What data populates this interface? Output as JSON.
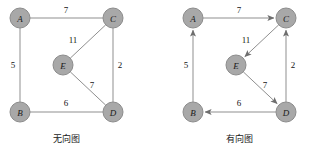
{
  "figure": {
    "width": 323,
    "height": 156,
    "background": "#ffffff",
    "node_fill": "#a8a8a8",
    "node_stroke": "#8c8c8c",
    "edge_color": "#8f8f8f",
    "text_color": "#1a1a1a"
  },
  "graphs": [
    {
      "id": "undirected-graph",
      "caption": "无向图",
      "caption_x": 66,
      "caption_y": 139,
      "directed": false,
      "nodes": [
        {
          "id": "A",
          "label": "A",
          "cx": 20,
          "cy": 18,
          "r": 10
        },
        {
          "id": "C",
          "label": "C",
          "cx": 113,
          "cy": 18,
          "r": 10
        },
        {
          "id": "E",
          "label": "E",
          "cx": 63,
          "cy": 65,
          "r": 10
        },
        {
          "id": "B",
          "label": "B",
          "cx": 20,
          "cy": 112,
          "r": 10
        },
        {
          "id": "D",
          "label": "D",
          "cx": 113,
          "cy": 112,
          "r": 10
        }
      ],
      "edges": [
        {
          "id": "A-C",
          "from": "A",
          "to": "C",
          "weight": "7",
          "lx": 66,
          "ly": 10
        },
        {
          "id": "A-B",
          "from": "A",
          "to": "B",
          "weight": "5",
          "lx": 13,
          "ly": 65
        },
        {
          "id": "C-E",
          "from": "C",
          "to": "E",
          "weight": "11",
          "lx": 73,
          "ly": 40
        },
        {
          "id": "C-D",
          "from": "C",
          "to": "D",
          "weight": "2",
          "lx": 120,
          "ly": 65
        },
        {
          "id": "E-D",
          "from": "E",
          "to": "D",
          "weight": "7",
          "lx": 92,
          "ly": 85
        },
        {
          "id": "B-D",
          "from": "B",
          "to": "D",
          "weight": "6",
          "lx": 66,
          "ly": 103
        }
      ]
    },
    {
      "id": "directed-graph",
      "caption": "有向图",
      "caption_x": 239,
      "caption_y": 139,
      "directed": true,
      "nodes": [
        {
          "id": "A",
          "label": "A",
          "cx": 193,
          "cy": 18,
          "r": 10
        },
        {
          "id": "C",
          "label": "C",
          "cx": 286,
          "cy": 18,
          "r": 10
        },
        {
          "id": "E",
          "label": "E",
          "cx": 236,
          "cy": 65,
          "r": 10
        },
        {
          "id": "B",
          "label": "B",
          "cx": 193,
          "cy": 112,
          "r": 10
        },
        {
          "id": "D",
          "label": "D",
          "cx": 286,
          "cy": 112,
          "r": 10
        }
      ],
      "edges": [
        {
          "id": "A-to-C",
          "from": "A",
          "to": "C",
          "weight": "7",
          "lx": 239,
          "ly": 10
        },
        {
          "id": "B-to-A",
          "from": "B",
          "to": "A",
          "weight": "5",
          "lx": 186,
          "ly": 65
        },
        {
          "id": "C-to-E",
          "from": "C",
          "to": "E",
          "weight": "11",
          "lx": 246,
          "ly": 40
        },
        {
          "id": "D-to-C",
          "from": "D",
          "to": "C",
          "weight": "2",
          "lx": 293,
          "ly": 65
        },
        {
          "id": "E-to-D",
          "from": "E",
          "to": "D",
          "weight": "7",
          "lx": 265,
          "ly": 85
        },
        {
          "id": "D-to-B",
          "from": "D",
          "to": "B",
          "weight": "6",
          "lx": 239,
          "ly": 103
        }
      ]
    }
  ]
}
